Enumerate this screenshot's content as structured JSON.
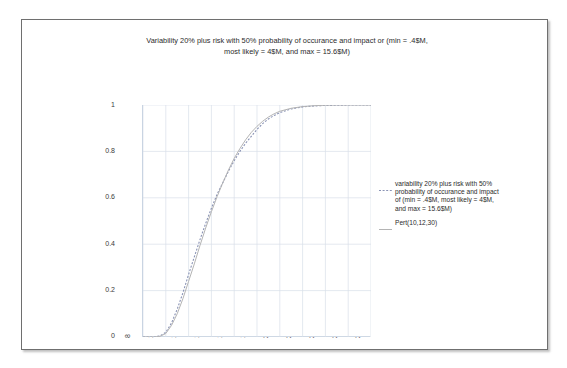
{
  "chart_data": {
    "type": "line",
    "title": "Variability 20% plus risk with 50% probability of occurance and impact or (min = .4$M, most likely = 4$M, and max = 15.6$M)",
    "title_lines": [
      "Variability 20% plus risk with 50% probability of occurance and impact or (min = .4$M,",
      "most likely = 4$M, and max = 15.6$M)"
    ],
    "xlabel": "",
    "ylabel": "",
    "xlim": [
      8,
      28
    ],
    "ylim": [
      0,
      1
    ],
    "grid": true,
    "legend_position": "right",
    "x_ticks": [
      8,
      10,
      12,
      14,
      16,
      18,
      20,
      22,
      24,
      26,
      28
    ],
    "x_tick_labels": [
      "8",
      "10",
      "12",
      "14",
      "16",
      "18",
      "20",
      "22",
      "24",
      "26",
      "28"
    ],
    "y_ticks": [
      0,
      0.2,
      0.4,
      0.6,
      0.8,
      1
    ],
    "y_tick_labels": [
      "0",
      "0.2",
      "0.4",
      "0.6",
      "0.8",
      "1"
    ],
    "series": [
      {
        "name": "variability 20% plus risk with 50% probability of occurance and impact of (min = .4$M, most likely = 4$M, and max = 15.6$M)",
        "style": "dashed",
        "color": "#8a93b5",
        "x": [
          8,
          9,
          9.5,
          10,
          10.5,
          11,
          11.5,
          12,
          12.5,
          13,
          13.5,
          14,
          14.5,
          15,
          15.5,
          16,
          16.5,
          17,
          17.5,
          18,
          18.5,
          19,
          19.5,
          20,
          21,
          22,
          23,
          24,
          25,
          26,
          27,
          28
        ],
        "y": [
          0,
          0,
          0.005,
          0.02,
          0.06,
          0.12,
          0.19,
          0.27,
          0.345,
          0.42,
          0.49,
          0.555,
          0.615,
          0.665,
          0.715,
          0.76,
          0.8,
          0.835,
          0.865,
          0.895,
          0.92,
          0.94,
          0.955,
          0.967,
          0.983,
          0.992,
          0.996,
          0.998,
          0.999,
          1,
          1,
          1
        ]
      },
      {
        "name": "Pert(10,12,30)",
        "style": "solid",
        "color": "#b4b4b4",
        "x": [
          8,
          9,
          9.5,
          10,
          10.5,
          11,
          11.5,
          12,
          12.5,
          13,
          13.5,
          14,
          14.5,
          15,
          15.5,
          16,
          16.5,
          17,
          17.5,
          18,
          18.5,
          19,
          19.5,
          20,
          21,
          22,
          23,
          24,
          25,
          26,
          27,
          28
        ],
        "y": [
          0,
          0,
          0.003,
          0.015,
          0.05,
          0.1,
          0.165,
          0.24,
          0.315,
          0.395,
          0.47,
          0.54,
          0.605,
          0.665,
          0.72,
          0.77,
          0.812,
          0.85,
          0.882,
          0.908,
          0.93,
          0.948,
          0.962,
          0.973,
          0.986,
          0.993,
          0.997,
          0.999,
          1,
          1,
          1,
          1
        ]
      }
    ],
    "legend_entries": [
      {
        "style": "dashed",
        "lines": [
          "variability 20% plus risk with 50%",
          "probability of occurance and impact",
          "of (min = .4$M, most likely = 4$M,",
          "and max = 15.6$M)"
        ]
      },
      {
        "style": "solid",
        "lines": [
          "Pert(10,12,30)"
        ]
      }
    ],
    "colors": {
      "series_1": "#8a93b5",
      "series_2": "#b4b4b4",
      "grid": "#d9e0ea",
      "axis": "#c9d4e2",
      "frame": "#6f6f6f",
      "text": "#2b2b2b",
      "background": "#ffffff"
    }
  }
}
